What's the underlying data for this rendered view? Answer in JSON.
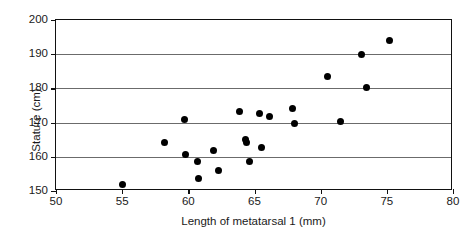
{
  "chart_data": {
    "type": "scatter",
    "title": "",
    "xlabel": "Length of metatarsal 1 (mm)",
    "ylabel": "Stature (cm)",
    "xlim": [
      50,
      80
    ],
    "ylim": [
      150,
      200
    ],
    "xticks": [
      50,
      55,
      60,
      65,
      70,
      75,
      80
    ],
    "yticks": [
      150,
      160,
      170,
      180,
      190,
      200
    ],
    "gridlines_y": [
      160,
      170,
      180,
      190
    ],
    "grid": "horizontal",
    "legend": "none",
    "marker": "filled-circle",
    "marker_color": "#000000",
    "points": [
      {
        "x": 55.0,
        "y": 152.0
      },
      {
        "x": 58.2,
        "y": 164.3
      },
      {
        "x": 59.7,
        "y": 171.0
      },
      {
        "x": 59.8,
        "y": 160.7
      },
      {
        "x": 60.7,
        "y": 158.7
      },
      {
        "x": 60.8,
        "y": 153.8
      },
      {
        "x": 61.9,
        "y": 161.7
      },
      {
        "x": 62.3,
        "y": 156.1
      },
      {
        "x": 63.9,
        "y": 173.2
      },
      {
        "x": 64.3,
        "y": 165.0
      },
      {
        "x": 64.4,
        "y": 164.1
      },
      {
        "x": 64.6,
        "y": 158.7
      },
      {
        "x": 65.4,
        "y": 172.6
      },
      {
        "x": 65.5,
        "y": 162.7
      },
      {
        "x": 66.1,
        "y": 171.8
      },
      {
        "x": 67.9,
        "y": 174.1
      },
      {
        "x": 68.0,
        "y": 169.6
      },
      {
        "x": 70.5,
        "y": 183.4
      },
      {
        "x": 71.5,
        "y": 170.4
      },
      {
        "x": 73.1,
        "y": 190.0
      },
      {
        "x": 73.5,
        "y": 180.2
      },
      {
        "x": 75.2,
        "y": 194.1
      }
    ]
  }
}
